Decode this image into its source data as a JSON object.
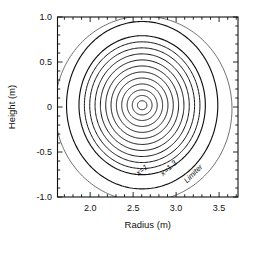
{
  "figure": {
    "name": "tokamak-flux-surface-cross-section",
    "background": "#ffffff",
    "line_color": "#111111",
    "limiter_color": "#555555"
  },
  "axes": {
    "xlabel": "Radius (m)",
    "ylabel": "Height (m)",
    "x_ticks": [
      "2.0",
      "2.5",
      "3.0",
      "3.5"
    ],
    "x_tick_values": [
      2.0,
      2.5,
      3.0,
      3.5
    ],
    "y_ticks": [
      "1.0",
      "0.5",
      "0",
      "-0.5",
      "-1.0"
    ],
    "y_tick_values": [
      1.0,
      0.5,
      0,
      -0.5,
      -1.0
    ],
    "xlim": [
      1.62,
      3.72
    ],
    "ylim": [
      -1.0,
      1.0
    ],
    "minor_ticks_per_major_x": 5,
    "minor_ticks_per_major_y": 5,
    "frame": true,
    "grid": false,
    "tick_direction": "in"
  },
  "annotations": [
    {
      "name": "label-x-1",
      "text": "x=1",
      "x": 2.62,
      "y": -0.72,
      "rotation": -38
    },
    {
      "name": "label-x-1p3",
      "text": "x=1.3",
      "x": 2.93,
      "y": -0.7,
      "rotation": -42
    },
    {
      "name": "label-limiter",
      "text": "Limiter",
      "x": 3.22,
      "y": -0.76,
      "rotation": -45
    }
  ],
  "chart_data": {
    "type": "line",
    "title": "",
    "xlabel": "Radius (m)",
    "ylabel": "Height (m)",
    "xlim": [
      1.62,
      3.72
    ],
    "ylim": [
      -1.0,
      1.0
    ],
    "grid": false,
    "legend": "none",
    "magnetic_axis": {
      "R": 2.6,
      "Z": 0.02
    },
    "limiter": {
      "center_R": 2.62,
      "center_Z": -0.02,
      "radius": 1.03,
      "style": "thin"
    },
    "series": [
      {
        "name": "x=0.08",
        "R_center": 2.605,
        "Z_center": 0.02,
        "a": 0.055,
        "b": 0.05,
        "shift": 0.0,
        "elongation": 0.91
      },
      {
        "name": "x=0.17",
        "R_center": 2.6,
        "Z_center": 0.02,
        "a": 0.115,
        "b": 0.108,
        "shift": 0.005,
        "elongation": 0.94
      },
      {
        "name": "x=0.25",
        "R_center": 2.594,
        "Z_center": 0.02,
        "a": 0.175,
        "b": 0.17,
        "shift": 0.011,
        "elongation": 0.97
      },
      {
        "name": "x=0.33",
        "R_center": 2.588,
        "Z_center": 0.02,
        "a": 0.238,
        "b": 0.236,
        "shift": 0.017,
        "elongation": 0.99
      },
      {
        "name": "x=0.42",
        "R_center": 2.58,
        "Z_center": 0.02,
        "a": 0.3,
        "b": 0.302,
        "shift": 0.025,
        "elongation": 1.01
      },
      {
        "name": "x=0.50",
        "R_center": 2.572,
        "Z_center": 0.02,
        "a": 0.362,
        "b": 0.369,
        "shift": 0.033,
        "elongation": 1.02
      },
      {
        "name": "x=0.58",
        "R_center": 2.563,
        "Z_center": 0.02,
        "a": 0.424,
        "b": 0.436,
        "shift": 0.042,
        "elongation": 1.03
      },
      {
        "name": "x=0.67",
        "R_center": 2.553,
        "Z_center": 0.02,
        "a": 0.486,
        "b": 0.503,
        "shift": 0.052,
        "elongation": 1.035
      },
      {
        "name": "x=0.75",
        "R_center": 2.542,
        "Z_center": 0.02,
        "a": 0.548,
        "b": 0.57,
        "shift": 0.063,
        "elongation": 1.04
      },
      {
        "name": "x=0.83",
        "R_center": 2.53,
        "Z_center": 0.02,
        "a": 0.61,
        "b": 0.637,
        "shift": 0.075,
        "elongation": 1.044
      },
      {
        "name": "x=0.92",
        "R_center": 2.517,
        "Z_center": 0.02,
        "a": 0.672,
        "b": 0.704,
        "shift": 0.088,
        "elongation": 1.048
      },
      {
        "name": "x=1",
        "R_center": 2.503,
        "Z_center": 0.02,
        "a": 0.735,
        "b": 0.772,
        "shift": 0.102,
        "elongation": 1.05,
        "labeled": true
      },
      {
        "name": "x=1.3",
        "R_center": 2.47,
        "Z_center": 0.02,
        "a": 0.88,
        "b": 0.93,
        "shift": 0.135,
        "elongation": 1.057,
        "labeled": true
      }
    ],
    "series_count": 13,
    "labeled_series": [
      "x=1",
      "x=1.3"
    ]
  }
}
